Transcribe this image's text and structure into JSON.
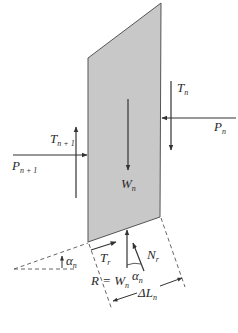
{
  "diagram": {
    "type": "slice free-body diagram",
    "slice": {
      "fill": "#c8c8c8",
      "stroke": "#555555"
    },
    "labels": {
      "T_n": {
        "main": "T",
        "sub": "n"
      },
      "P_n": {
        "main": "P",
        "sub": "n"
      },
      "T_n1": {
        "main": "T",
        "sub": "n + 1"
      },
      "P_n1": {
        "main": "P",
        "sub": "n + 1"
      },
      "W_n": {
        "main": "W",
        "sub": "n"
      },
      "T_r": {
        "main": "T",
        "sub": "r"
      },
      "N_r": {
        "main": "N",
        "sub": "r"
      },
      "alpha_base": {
        "main": "α",
        "sub": "n"
      },
      "alpha_left": {
        "main": "α",
        "sub": "n"
      },
      "R": {
        "main": "R = W",
        "sub": "n"
      },
      "dL": {
        "main": "ΔL",
        "sub": "n"
      }
    },
    "colors": {
      "line": "#333333",
      "dash": "#555555"
    }
  }
}
